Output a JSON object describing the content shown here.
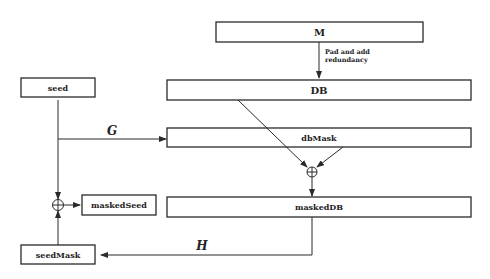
{
  "diagram": {
    "boxes": {
      "M": "M",
      "DB": "DB",
      "seed": "seed",
      "dbMask": "dbMask",
      "maskedSeed": "maskedSeed",
      "maskedDB": "maskedDB",
      "seedMask": "seedMask"
    },
    "annotations": {
      "pad_line1": "Pad and add",
      "pad_line2": "redundancy",
      "G": "G",
      "H": "H"
    },
    "operators": {
      "xor": "⊕"
    }
  }
}
